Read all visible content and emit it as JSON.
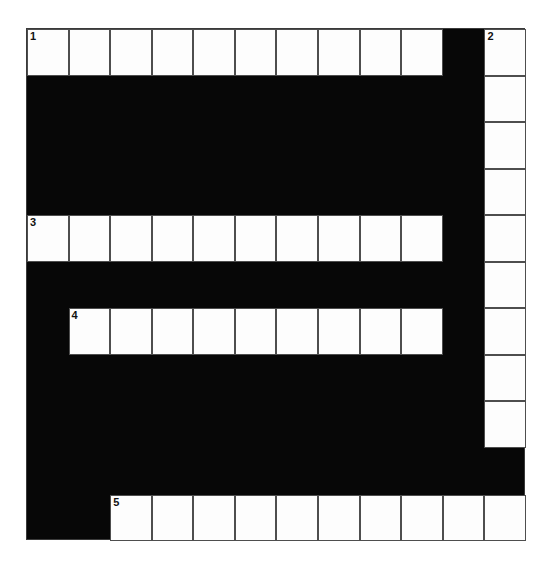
{
  "puzzle": {
    "title": "Crossword Grid",
    "type": "crossword-grid",
    "columns": 12,
    "rows": 11,
    "cell_width": 41.58,
    "cell_height": 46.55,
    "origin_x": 26,
    "origin_y": 28,
    "colors": {
      "block": "#070707",
      "cell_fill": "#fdfdfd",
      "cell_border": "#4e4e4e",
      "number_text": "#111111",
      "page_background": "#ffffff"
    },
    "entries": [
      {
        "number": "1",
        "direction": "across",
        "row": 0,
        "col": 0,
        "length": 10
      },
      {
        "number": "2",
        "direction": "down",
        "row": 0,
        "col": 11,
        "length": 9
      },
      {
        "number": "3",
        "direction": "across",
        "row": 4,
        "col": 0,
        "length": 10
      },
      {
        "number": "4",
        "direction": "across",
        "row": 6,
        "col": 1,
        "length": 9
      },
      {
        "number": "5",
        "direction": "across",
        "row": 10,
        "col": 2,
        "length": 10
      }
    ],
    "cells": [
      {
        "row": 0,
        "col": 0,
        "number": "1",
        "letter": ""
      },
      {
        "row": 0,
        "col": 1,
        "number": "",
        "letter": ""
      },
      {
        "row": 0,
        "col": 2,
        "number": "",
        "letter": ""
      },
      {
        "row": 0,
        "col": 3,
        "number": "",
        "letter": ""
      },
      {
        "row": 0,
        "col": 4,
        "number": "",
        "letter": ""
      },
      {
        "row": 0,
        "col": 5,
        "number": "",
        "letter": ""
      },
      {
        "row": 0,
        "col": 6,
        "number": "",
        "letter": ""
      },
      {
        "row": 0,
        "col": 7,
        "number": "",
        "letter": ""
      },
      {
        "row": 0,
        "col": 8,
        "number": "",
        "letter": ""
      },
      {
        "row": 0,
        "col": 9,
        "number": "",
        "letter": ""
      },
      {
        "row": 0,
        "col": 11,
        "number": "2",
        "letter": ""
      },
      {
        "row": 1,
        "col": 11,
        "number": "",
        "letter": ""
      },
      {
        "row": 2,
        "col": 11,
        "number": "",
        "letter": ""
      },
      {
        "row": 3,
        "col": 11,
        "number": "",
        "letter": ""
      },
      {
        "row": 4,
        "col": 0,
        "number": "3",
        "letter": ""
      },
      {
        "row": 4,
        "col": 1,
        "number": "",
        "letter": ""
      },
      {
        "row": 4,
        "col": 2,
        "number": "",
        "letter": ""
      },
      {
        "row": 4,
        "col": 3,
        "number": "",
        "letter": ""
      },
      {
        "row": 4,
        "col": 4,
        "number": "",
        "letter": ""
      },
      {
        "row": 4,
        "col": 5,
        "number": "",
        "letter": ""
      },
      {
        "row": 4,
        "col": 6,
        "number": "",
        "letter": ""
      },
      {
        "row": 4,
        "col": 7,
        "number": "",
        "letter": ""
      },
      {
        "row": 4,
        "col": 8,
        "number": "",
        "letter": ""
      },
      {
        "row": 4,
        "col": 9,
        "number": "",
        "letter": ""
      },
      {
        "row": 4,
        "col": 11,
        "number": "",
        "letter": ""
      },
      {
        "row": 5,
        "col": 11,
        "number": "",
        "letter": ""
      },
      {
        "row": 6,
        "col": 1,
        "number": "4",
        "letter": ""
      },
      {
        "row": 6,
        "col": 2,
        "number": "",
        "letter": ""
      },
      {
        "row": 6,
        "col": 3,
        "number": "",
        "letter": ""
      },
      {
        "row": 6,
        "col": 4,
        "number": "",
        "letter": ""
      },
      {
        "row": 6,
        "col": 5,
        "number": "",
        "letter": ""
      },
      {
        "row": 6,
        "col": 6,
        "number": "",
        "letter": ""
      },
      {
        "row": 6,
        "col": 7,
        "number": "",
        "letter": ""
      },
      {
        "row": 6,
        "col": 8,
        "number": "",
        "letter": ""
      },
      {
        "row": 6,
        "col": 9,
        "number": "",
        "letter": ""
      },
      {
        "row": 6,
        "col": 11,
        "number": "",
        "letter": ""
      },
      {
        "row": 7,
        "col": 11,
        "number": "",
        "letter": ""
      },
      {
        "row": 8,
        "col": 11,
        "number": "",
        "letter": ""
      },
      {
        "row": 10,
        "col": 2,
        "number": "5",
        "letter": ""
      },
      {
        "row": 10,
        "col": 3,
        "number": "",
        "letter": ""
      },
      {
        "row": 10,
        "col": 4,
        "number": "",
        "letter": ""
      },
      {
        "row": 10,
        "col": 5,
        "number": "",
        "letter": ""
      },
      {
        "row": 10,
        "col": 6,
        "number": "",
        "letter": ""
      },
      {
        "row": 10,
        "col": 7,
        "number": "",
        "letter": ""
      },
      {
        "row": 10,
        "col": 8,
        "number": "",
        "letter": ""
      },
      {
        "row": 10,
        "col": 9,
        "number": "",
        "letter": ""
      },
      {
        "row": 10,
        "col": 10,
        "number": "",
        "letter": ""
      },
      {
        "row": 10,
        "col": 11,
        "number": "",
        "letter": ""
      }
    ]
  }
}
